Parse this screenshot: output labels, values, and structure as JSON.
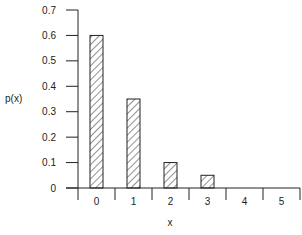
{
  "chart_data": {
    "type": "bar",
    "title": "",
    "xlabel": "x",
    "ylabel": "p(x)",
    "categories": [
      "0",
      "1",
      "2",
      "3",
      "4",
      "5"
    ],
    "values": [
      0.6,
      0.35,
      0.1,
      0.05,
      0,
      0
    ],
    "ylim": [
      0,
      0.7
    ],
    "yticks": [
      "0",
      "0.1",
      "0.2",
      "0.3",
      "0.4",
      "0.5",
      "0.6",
      "0.7"
    ],
    "grid": false,
    "legend": null,
    "bar_fill": "hatched",
    "colors": {
      "axis": "#222222",
      "bar_stroke": "#222222",
      "hatch": "#222222"
    }
  }
}
